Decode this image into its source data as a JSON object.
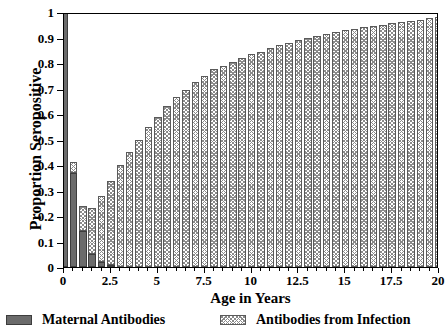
{
  "chart_data": {
    "type": "bar",
    "stacked": true,
    "title": "",
    "xlabel": "Age in Years",
    "ylabel": "Proportion Seropositive",
    "xlim": [
      0,
      20
    ],
    "ylim": [
      0,
      1
    ],
    "grid": false,
    "legend_position": "bottom",
    "bar_width_years": 0.5,
    "x_tick_labels": [
      "0",
      "2.5",
      "5",
      "7.5",
      "10",
      "12.5",
      "15",
      "17.5",
      "20"
    ],
    "x_tick_values": [
      0,
      2.5,
      5,
      7.5,
      10,
      12.5,
      15,
      17.5,
      20
    ],
    "y_tick_labels": [
      "0",
      "0.1",
      "0.2",
      "0.3",
      "0.4",
      "0.5",
      "0.6",
      "0.7",
      "0.8",
      "0.9",
      "1"
    ],
    "y_tick_values": [
      0,
      0.1,
      0.2,
      0.3,
      0.4,
      0.5,
      0.6,
      0.7,
      0.8,
      0.9,
      1
    ],
    "x": [
      0,
      0.5,
      1,
      1.5,
      2,
      2.5,
      3,
      3.5,
      4,
      4.5,
      5,
      5.5,
      6,
      6.5,
      7,
      7.5,
      8,
      8.5,
      9,
      9.5,
      10,
      10.5,
      11,
      11.5,
      12,
      12.5,
      13,
      13.5,
      14,
      14.5,
      15,
      15.5,
      16,
      16.5,
      17,
      17.5,
      18,
      18.5,
      19,
      19.5,
      20
    ],
    "series": [
      {
        "name": "Maternal Antibodies",
        "color": "#6b6b6b",
        "pattern": "solid",
        "values": [
          1.0,
          0.37,
          0.14,
          0.05,
          0.02,
          0.008,
          0.0,
          0.0,
          0.0,
          0.0,
          0.0,
          0.0,
          0.0,
          0.0,
          0.0,
          0.0,
          0.0,
          0.0,
          0.0,
          0.0,
          0.0,
          0.0,
          0.0,
          0.0,
          0.0,
          0.0,
          0.0,
          0.0,
          0.0,
          0.0,
          0.0,
          0.0,
          0.0,
          0.0,
          0.0,
          0.0,
          0.0,
          0.0,
          0.0,
          0.0,
          0.0
        ]
      },
      {
        "name": "Antibodies from Infection",
        "color": "#8a8a8a",
        "pattern": "crosshatch",
        "values": [
          0.0,
          0.04,
          0.1,
          0.18,
          0.26,
          0.33,
          0.4,
          0.45,
          0.5,
          0.55,
          0.59,
          0.63,
          0.665,
          0.695,
          0.725,
          0.75,
          0.775,
          0.79,
          0.805,
          0.82,
          0.835,
          0.845,
          0.86,
          0.87,
          0.88,
          0.89,
          0.9,
          0.905,
          0.915,
          0.92,
          0.93,
          0.935,
          0.94,
          0.945,
          0.95,
          0.955,
          0.96,
          0.965,
          0.97,
          0.975,
          0.98
        ]
      }
    ],
    "totals": [
      1.0,
      0.41,
      0.24,
      0.23,
      0.28,
      0.338,
      0.4,
      0.45,
      0.5,
      0.55,
      0.59,
      0.63,
      0.665,
      0.695,
      0.725,
      0.75,
      0.775,
      0.79,
      0.805,
      0.82,
      0.835,
      0.845,
      0.86,
      0.87,
      0.88,
      0.89,
      0.9,
      0.905,
      0.915,
      0.92,
      0.93,
      0.935,
      0.94,
      0.945,
      0.95,
      0.955,
      0.96,
      0.965,
      0.97,
      0.975,
      0.98
    ]
  },
  "legend": {
    "maternal_label": "Maternal Antibodies",
    "infection_label": "Antibodies from Infection"
  }
}
